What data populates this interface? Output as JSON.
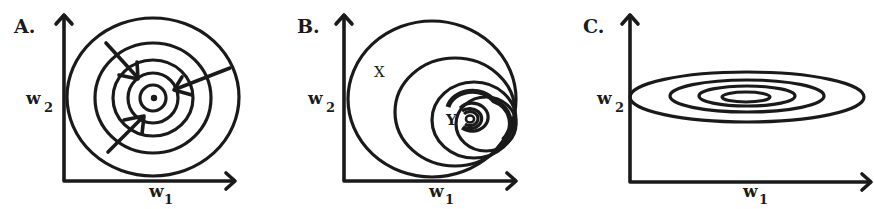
{
  "figure": {
    "panels": [
      {
        "id": "A",
        "letter": "A.",
        "x_label": "w",
        "x_sub": "1",
        "y_label": "w",
        "y_sub": "2",
        "description": "Concentric circular contours with arrows pointing toward the center"
      },
      {
        "id": "B",
        "letter": "B.",
        "x_label": "w",
        "x_sub": "1",
        "y_label": "w",
        "y_sub": "2",
        "point_x": "X",
        "point_y": "Y",
        "description": "Nested non-concentric contours converging toward point Y at lower right"
      },
      {
        "id": "C",
        "letter": "C.",
        "x_label": "w",
        "x_sub": "1",
        "y_label": "w",
        "y_sub": "2",
        "description": "Concentric elongated elliptical contours stretched along w1"
      }
    ],
    "colors": {
      "ink": "#1a1a1a",
      "background": "#ffffff"
    }
  }
}
